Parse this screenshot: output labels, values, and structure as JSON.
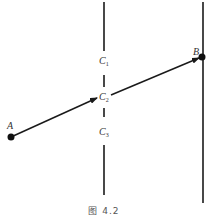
{
  "figure": {
    "caption": "图 4.2",
    "line_color": "#1a1a1a",
    "background": "#ffffff"
  },
  "points": {
    "A": {
      "label": "A",
      "x": 11,
      "y": 137
    },
    "B": {
      "label": "B",
      "x": 202,
      "y": 57
    }
  },
  "slits": {
    "C1": {
      "label": "C",
      "sub": "1"
    },
    "C2": {
      "label": "C",
      "sub": "2"
    },
    "C3": {
      "label": "C",
      "sub": "3"
    }
  },
  "barrier": {
    "x": 104,
    "segments": [
      [
        2,
        51
      ],
      [
        75,
        87
      ],
      [
        108,
        117
      ],
      [
        145,
        195
      ]
    ]
  },
  "screen": {
    "x": 203,
    "y1": 2,
    "y2": 203
  },
  "path": {
    "from": "A",
    "via": "C2",
    "to": "B"
  }
}
